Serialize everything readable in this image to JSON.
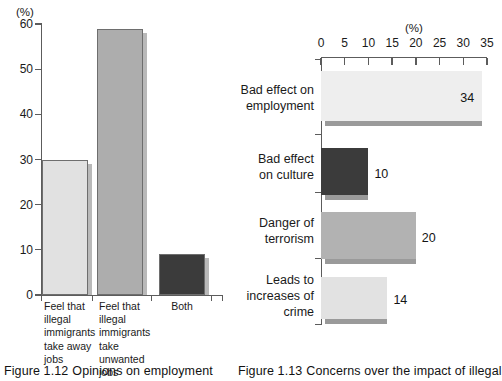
{
  "chart_data": [
    {
      "type": "bar",
      "orientation": "vertical",
      "title": "",
      "axis_unit_label": "(%)",
      "categories": [
        "Feel that illegal immigrants take away jobs",
        "Feel that illegal immigrants take unwanted jobs",
        "Both"
      ],
      "category_lines": [
        [
          "Feel that",
          "illegal",
          "immigrants",
          "take away",
          "jobs"
        ],
        [
          "Feel that",
          "illegal",
          "immigrants",
          "take unwanted",
          "jobs"
        ],
        [
          "Both"
        ]
      ],
      "values": [
        30,
        59,
        9
      ],
      "bar_colors": [
        "#e1e1e1",
        "#adadad",
        "#3b3b3b"
      ],
      "xlabel": "",
      "ylabel": "",
      "ylim": [
        0,
        60
      ],
      "yticks": [
        0,
        10,
        20,
        30,
        40,
        50,
        60
      ],
      "ytick_labels": [
        "0",
        "10",
        "20",
        "30",
        "40",
        "50",
        "60"
      ],
      "grid": false,
      "legend": false,
      "caption_number": "Figure 1.12",
      "caption_text": "Opinions on employment"
    },
    {
      "type": "bar",
      "orientation": "horizontal",
      "title": "",
      "axis_unit_label": "(%)",
      "categories": [
        "Bad effect on employment",
        "Bad effect on culture",
        "Danger of terrorism",
        "Leads to increases of crime"
      ],
      "category_lines": [
        [
          "Bad effect on",
          "employment"
        ],
        [
          "Bad effect",
          "on culture"
        ],
        [
          "Danger of",
          "terrorism"
        ],
        [
          "Leads to",
          "increases of",
          "crime"
        ]
      ],
      "values": [
        34,
        10,
        20,
        14
      ],
      "value_labels": [
        "34",
        "10",
        "20",
        "14"
      ],
      "value_label_inside": [
        true,
        false,
        false,
        false
      ],
      "bar_colors": [
        "#eeeeee",
        "#3b3b3b",
        "#b2b2b2",
        "#e2e2e2"
      ],
      "xlabel": "",
      "ylabel": "",
      "xlim": [
        0,
        35
      ],
      "xticks": [
        0,
        5,
        10,
        15,
        20,
        25,
        30,
        35
      ],
      "xtick_labels": [
        "0",
        "5",
        "10",
        "15",
        "20",
        "25",
        "30",
        "35"
      ],
      "grid": false,
      "legend": false,
      "caption_number": "Figure 1.13",
      "caption_text": "Concerns over the impact of illegal"
    }
  ]
}
